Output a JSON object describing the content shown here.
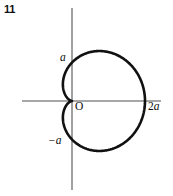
{
  "figure": {
    "number": "11",
    "background_color": "#ffffff",
    "curve_color": "#111111",
    "axis_color": "#8a8a8a",
    "text_color": "#0d0d0d"
  },
  "labels": {
    "y_positive": "a",
    "y_negative": "−a",
    "origin": "O",
    "x_positive_num": "2",
    "x_positive_sym": "a"
  },
  "chart_data": {
    "type": "line",
    "title": "",
    "subtitle": "",
    "xlabel": "",
    "ylabel": "",
    "legend": [],
    "grid": false,
    "curve_name": "cardioid",
    "polar_equation": "r = a(1 + cos θ)",
    "parameter": "a",
    "axis_tick_labels": {
      "x": [
        "O",
        "2a"
      ],
      "y": [
        "a",
        "−a"
      ]
    },
    "axis_ranges": {
      "x": [
        -0.7,
        2.45
      ],
      "y": [
        -1.45,
        1.45
      ]
    },
    "key_points": [
      {
        "name": "cusp",
        "x": 0,
        "y": 0,
        "label": "O"
      },
      {
        "name": "rightmost",
        "x": 2,
        "y": 0,
        "label": "2a"
      },
      {
        "name": "top",
        "x": 0.75,
        "y": 1.3,
        "label": ""
      },
      {
        "name": "bottom",
        "x": 0.75,
        "y": -1.3,
        "label": ""
      },
      {
        "name": "y-axis-upper-crossing",
        "x": 0,
        "y": 1,
        "label": "a"
      },
      {
        "name": "y-axis-lower-crossing",
        "x": 0,
        "y": -1,
        "label": "−a"
      }
    ],
    "series": [
      {
        "name": "cardioid",
        "theta_deg": [
          0,
          15,
          30,
          45,
          60,
          75,
          90,
          105,
          120,
          135,
          150,
          165,
          180,
          195,
          210,
          225,
          240,
          255,
          270,
          285,
          300,
          315,
          330,
          345,
          360
        ],
        "r": [
          2.0,
          1.966,
          1.866,
          1.707,
          1.5,
          1.259,
          1.0,
          0.741,
          0.5,
          0.293,
          0.134,
          0.034,
          0.0,
          0.034,
          0.134,
          0.293,
          0.5,
          0.741,
          1.0,
          1.259,
          1.5,
          1.707,
          1.866,
          1.966,
          2.0
        ],
        "x": [
          2.0,
          1.899,
          1.616,
          1.207,
          0.75,
          0.326,
          0.0,
          -0.192,
          -0.25,
          -0.207,
          -0.116,
          -0.033,
          0.0,
          -0.033,
          -0.116,
          -0.207,
          -0.25,
          -0.192,
          0.0,
          0.326,
          0.75,
          1.207,
          1.616,
          1.899,
          2.0
        ],
        "y": [
          0.0,
          0.509,
          0.933,
          1.207,
          1.299,
          1.216,
          1.0,
          0.716,
          0.433,
          0.207,
          0.067,
          0.009,
          0.0,
          -0.009,
          -0.067,
          -0.207,
          -0.433,
          -0.716,
          -1.0,
          -1.216,
          -1.299,
          -1.207,
          -0.933,
          -0.509,
          0.0
        ]
      }
    ]
  }
}
